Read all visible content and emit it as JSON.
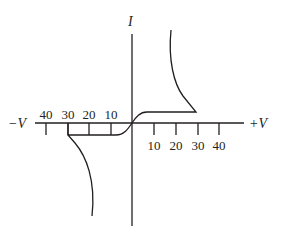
{
  "diagram": {
    "type": "i-v-characteristic",
    "colors": {
      "ink": "#231f20",
      "background": "#ffffff"
    },
    "axes": {
      "vertical_label": "I",
      "negative_label": "−V",
      "positive_label": "+V"
    },
    "ticks": {
      "positive": [
        "10",
        "20",
        "30",
        "40"
      ],
      "negative": [
        "40",
        "30",
        "20",
        "10"
      ]
    },
    "curve": {
      "breakover_voltage_positive": 30,
      "breakover_voltage_negative": -30
    }
  }
}
